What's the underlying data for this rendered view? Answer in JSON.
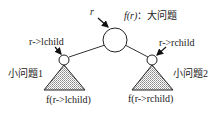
{
  "diagram": {
    "type": "binary-tree-divide-and-conquer",
    "root": {
      "pointer_label": "r",
      "function_label": "f(r)",
      "separator": "：",
      "description": "大问题"
    },
    "left": {
      "pointer_label": "r->lchild",
      "subproblem_label": "小问题1",
      "function_label": "f(r->lchild)"
    },
    "right": {
      "pointer_label": "r->rchild",
      "subproblem_label": "小问题2",
      "function_label": "f(r->rchild)"
    },
    "colors": {
      "stroke": "#222222",
      "fill_pattern": "#999999"
    }
  }
}
